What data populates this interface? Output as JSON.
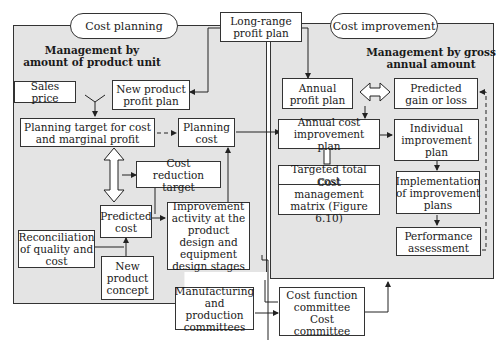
{
  "top": {
    "long_range_plan": "Long-range profit plan"
  },
  "left_panel": {
    "title": "Cost planning",
    "heading": "Management by amount of product unit",
    "boxes": {
      "sales_price": "Sales price",
      "new_product_profit_plan": "New product profit plan",
      "planning_target": "Planning target for cost and marginal profit",
      "planning_cost": "Planning cost",
      "cost_reduction_target": "Cost reduction target",
      "predicted_cost": "Predicted cost",
      "improvement_activity": "Improvement activity at the product design and equipment design stages",
      "reconciliation": "Reconciliation of quality and cost",
      "new_product_concept": "New product concept"
    }
  },
  "right_panel": {
    "title": "Cost improvement",
    "heading": "Management by gross annual amount",
    "boxes": {
      "annual_profit_plan": "Annual profit plan",
      "predicted_gain_loss": "Predicted gain or loss",
      "annual_cost_improvement_plan": "Annual cost improvement plan",
      "individual_improvement_plan": "Individual improvement plan",
      "targeted_total_cost": "Targeted total cost",
      "cost_management_matrix": "Cost management matrix (Figure 6.10)",
      "implementation": "Implementation of improvement plans",
      "performance_assessment": "Performance assessment"
    }
  },
  "bottom": {
    "manufacturing_committees": "Manufacturing and production committees",
    "cost_function_committee": "Cost function committee",
    "cost_committee": "Cost committee"
  }
}
